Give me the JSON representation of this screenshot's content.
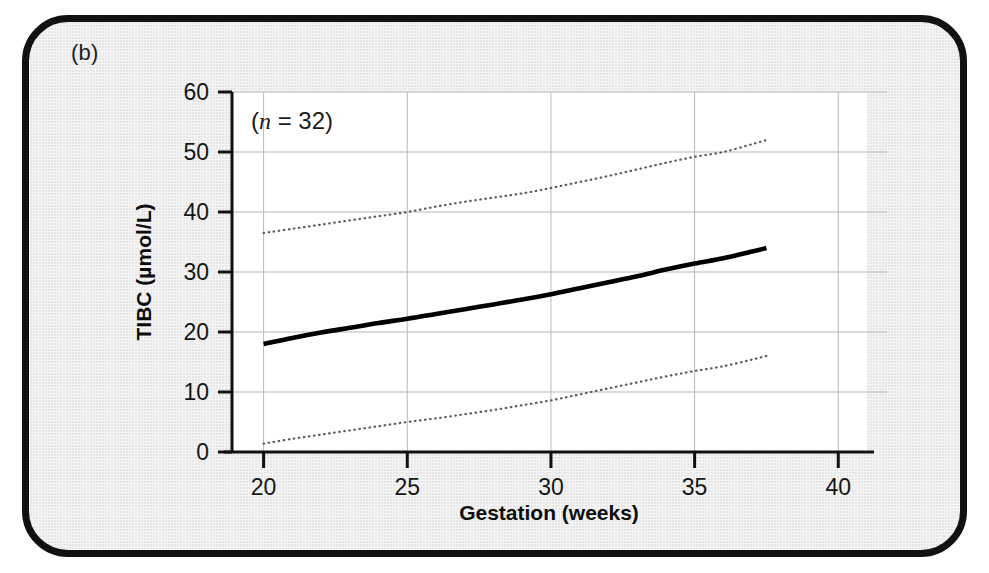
{
  "figure": {
    "panel_label": "(b)",
    "background_color": "#e7e7e7",
    "border_color": "#111111",
    "plot_background": "#ffffff"
  },
  "annotation": {
    "prefix": "(",
    "symbol": "n",
    "equals": " = ",
    "value": "32",
    "suffix": ")",
    "full_text": "(n = 32)"
  },
  "chart_data": {
    "type": "line",
    "title": "",
    "subtitle": "",
    "xlabel": "Gestation (weeks)",
    "ylabel": "TIBC (µmol/L)",
    "xlim": [
      18.9,
      41.0
    ],
    "ylim": [
      0,
      60
    ],
    "xticks": [
      20,
      25,
      30,
      35,
      40
    ],
    "xtick_labels": [
      "20",
      "25",
      "30",
      "35",
      "40"
    ],
    "yticks": [
      0,
      10,
      20,
      30,
      40,
      50,
      60
    ],
    "ytick_labels": [
      "0",
      "10",
      "20",
      "30",
      "40",
      "50",
      "60"
    ],
    "grid": true,
    "grid_color": "#b9b9b9",
    "legend": "none",
    "annotations": [
      "(n = 32)"
    ],
    "n": 32,
    "x": [
      20,
      21,
      22,
      23,
      24,
      25,
      26,
      27,
      28,
      29,
      30,
      31,
      32,
      33,
      34,
      35,
      36,
      37,
      37.5
    ],
    "series": [
      {
        "name": "upper 95% reference limit",
        "style": "dotted",
        "color": "#5a5a5a",
        "values": [
          36.5,
          37.2,
          37.9,
          38.6,
          39.3,
          40.0,
          40.9,
          41.7,
          42.4,
          43.1,
          44.0,
          45.0,
          46.0,
          47.1,
          48.2,
          49.2,
          50.0,
          51.3,
          52.0
        ]
      },
      {
        "name": "mean / median",
        "style": "solid",
        "color": "#000000",
        "values": [
          18.0,
          19.0,
          19.9,
          20.7,
          21.5,
          22.2,
          23.0,
          23.8,
          24.6,
          25.4,
          26.3,
          27.3,
          28.3,
          29.3,
          30.4,
          31.4,
          32.3,
          33.4,
          34.0
        ]
      },
      {
        "name": "lower 95% reference limit",
        "style": "dotted",
        "color": "#5a5a5a",
        "values": [
          1.4,
          2.2,
          2.9,
          3.6,
          4.3,
          5.0,
          5.6,
          6.3,
          7.0,
          7.8,
          8.6,
          9.6,
          10.6,
          11.6,
          12.6,
          13.5,
          14.3,
          15.4,
          16.0
        ]
      }
    ]
  }
}
